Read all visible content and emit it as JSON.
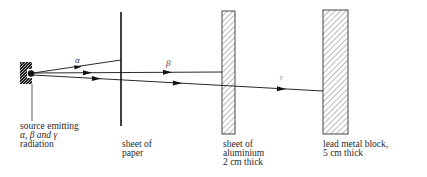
{
  "diagram": {
    "rays": [
      {
        "id": "alpha",
        "symbol": "α",
        "stopped_by": "sheet of paper"
      },
      {
        "id": "beta",
        "symbol": "β",
        "stopped_by": "sheet of aluminium"
      },
      {
        "id": "gamma",
        "symbol": "γ",
        "stopped_by": "lead metal block"
      }
    ],
    "labels": {
      "source": [
        "source emitting",
        "α, β and γ",
        "radiation"
      ],
      "paper": [
        "sheet of",
        "paper"
      ],
      "aluminium": [
        "sheet of",
        "aluminium",
        "2 cm thick"
      ],
      "lead": [
        "lead metal block,",
        "5 cm thick"
      ]
    },
    "colors": {
      "line": "#1a1a1a",
      "hatch": "#555555",
      "background": "#ffffff"
    }
  }
}
